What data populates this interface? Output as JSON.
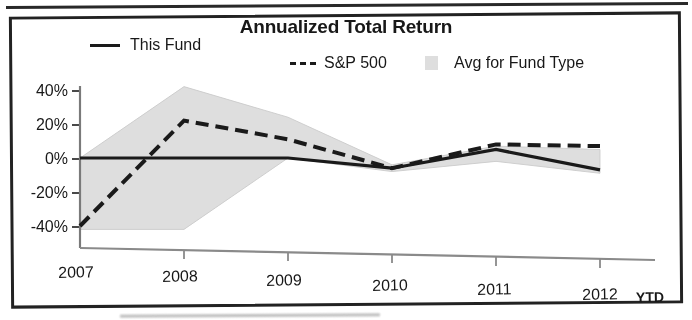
{
  "chart_data": {
    "type": "line",
    "title": "Annualized Total Return",
    "xlabel": "",
    "ylabel": "",
    "ylim": [
      -48,
      48
    ],
    "ytick_labels": [
      "40%",
      "20%",
      "0%",
      "-20%",
      "-40%"
    ],
    "ytick_values": [
      40,
      20,
      0,
      -20,
      -40
    ],
    "grid": false,
    "legend_position": "top",
    "categories": [
      "2007",
      "2008",
      "2009",
      "2010",
      "2011",
      "2012"
    ],
    "x_axis_note": "YTD",
    "series": [
      {
        "name": "This Fund",
        "style": "solid",
        "color": "#1c1c1c",
        "values": [
          0,
          0,
          0,
          -6,
          5,
          -7
        ]
      },
      {
        "name": "S&P 500",
        "style": "dashed",
        "color": "#1c1c1c",
        "values": [
          -40,
          22,
          11,
          -6,
          8,
          7
        ]
      },
      {
        "name": "Avg for Fund Type",
        "style": "band",
        "color": "#dcdcdc",
        "band_upper": [
          0,
          42,
          24,
          -4,
          7,
          5
        ],
        "band_lower": [
          -42,
          -42,
          0,
          -8,
          -2,
          -9
        ]
      }
    ]
  },
  "chart": {
    "title": "Annualized Total Return",
    "legend": [
      {
        "label": "This Fund",
        "marker": "solid-line-swatch"
      },
      {
        "label": "S&P 500",
        "marker": "dashed-line-swatch"
      },
      {
        "label": "Avg for Fund Type",
        "marker": "shaded-box-swatch"
      }
    ],
    "y_axis": {
      "labels": [
        "40%",
        "20%",
        "0%",
        "-20%",
        "-40%"
      ]
    },
    "x_axis": {
      "labels": [
        "2007",
        "2008",
        "2009",
        "2010",
        "2011",
        "2012"
      ],
      "note": "YTD"
    },
    "colors": {
      "line": "#1c1c1c",
      "band": "#dcdcdc",
      "axis": "#6a6a6a",
      "frame": "#242424"
    }
  }
}
